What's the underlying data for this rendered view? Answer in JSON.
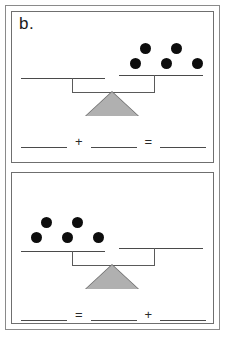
{
  "worksheet": {
    "label": "b.",
    "counter_icon": "black-counter-circle",
    "fulcrum_icon": "triangle-fulcrum-icon"
  },
  "panels": [
    {
      "id": "top",
      "balance": {
        "left_pan": {
          "counters": 0,
          "rows": []
        },
        "right_pan": {
          "counters": 5,
          "rows": [
            2,
            3
          ]
        },
        "tilt": "right-pan-raised"
      },
      "equation": {
        "parts": [
          "blank",
          "+",
          "blank",
          "=",
          "blank"
        ],
        "operator_1": "+",
        "operator_2": "="
      }
    },
    {
      "id": "bottom",
      "balance": {
        "left_pan": {
          "counters": 5,
          "rows": [
            2,
            3
          ]
        },
        "right_pan": {
          "counters": 0,
          "rows": []
        },
        "tilt": "right-pan-raised"
      },
      "equation": {
        "parts": [
          "blank",
          "=",
          "blank",
          "+",
          "blank"
        ],
        "operator_1": "=",
        "operator_2": "+"
      }
    }
  ]
}
